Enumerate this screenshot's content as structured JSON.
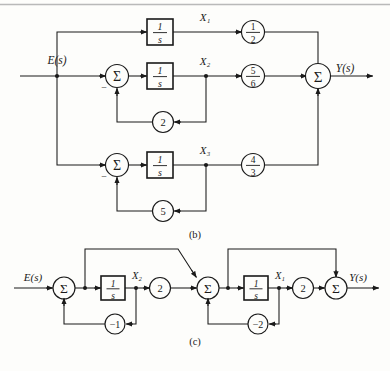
{
  "page": {
    "background": "#fdfdfb",
    "ink": "#1a1a1a",
    "top_rule": true
  },
  "figures": [
    {
      "id": "figure-b",
      "caption": "(b)",
      "input_label": "E(s)",
      "output_label": "Y(s)",
      "state_labels": [
        "X₁",
        "X₂",
        "X₃"
      ],
      "integrator_label_num": "1",
      "integrator_label_den": "s",
      "summer_symbol": "Σ",
      "sign_label": "−",
      "branches": [
        {
          "name": "branch-top",
          "state": "X₁",
          "gain_num": "1",
          "gain_den": "2",
          "has_summer": false,
          "feedback_gain": null
        },
        {
          "name": "branch-middle",
          "state": "X₂",
          "gain_num": "5",
          "gain_den": "6",
          "has_summer": true,
          "feedback_gain": "2"
        },
        {
          "name": "branch-bottom",
          "state": "X₃",
          "gain_num": "4",
          "gain_den": "3",
          "has_summer": true,
          "feedback_gain": "5"
        }
      ]
    },
    {
      "id": "figure-c",
      "caption": "(c)",
      "input_label": "E(s)",
      "output_label": "Y(s)",
      "summer_symbol": "Σ",
      "integrator_label_num": "1",
      "integrator_label_den": "s",
      "stages": [
        {
          "name": "stage-left",
          "state": "X₂",
          "forward_gain": "2",
          "feedback_gain": "−1"
        },
        {
          "name": "stage-right",
          "state": "X₁",
          "forward_gain": "2",
          "feedback_gain": "−2"
        }
      ]
    }
  ]
}
